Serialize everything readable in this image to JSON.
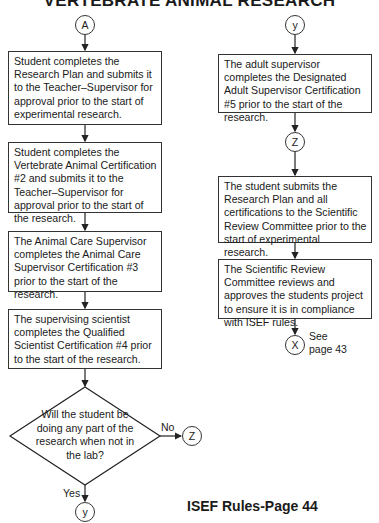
{
  "title": "VERTEBRATE ANIMAL RESEARCH",
  "connectors": {
    "a": "A",
    "y_top": "y",
    "z_mid": "Z",
    "z_no": "Z",
    "x_end": "X",
    "y_bottom": "y"
  },
  "left_column": {
    "steps": [
      "Student completes the Research Plan and submits it to the Teacher–Supervisor for approval prior to the start of experimental research.",
      "Student completes the Vertebrate Animal Certification #2 and submits it to the Teacher–Supervisor for approval prior to the start of the research.",
      "The Animal Care Supervisor completes the Animal Care Supervisor Certification #3 prior to the start of the research.",
      "The supervising scientist completes the Qualified Scientist Certification #4 prior to the start of the research."
    ],
    "decision": {
      "question": "Will the student be doing any part of the research when not in the lab?",
      "no_label": "No",
      "yes_label": "Yes"
    }
  },
  "right_column": {
    "steps": [
      "The adult supervisor completes the Designated Adult Supervisor Certification #5 prior to the start of the research.",
      "The student submits the Research Plan and all certifications to the Scientific Review Committee prior to the start of experimental research.",
      "The Scientific Review Committee reviews and approves the students project to ensure it is in compliance with ISEF rules."
    ],
    "see_page_line1": "See",
    "see_page_line2": "page 43"
  },
  "footer": "ISEF Rules-Page 44"
}
